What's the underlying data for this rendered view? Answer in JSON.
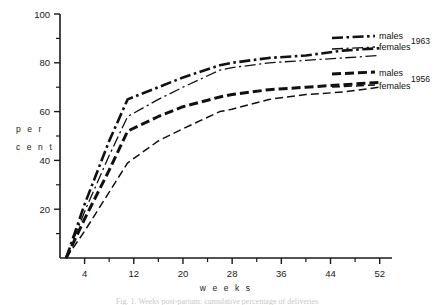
{
  "figure": {
    "caption": "Fig. 1. Weeks post-partum: cumulative percentage of deliveries"
  },
  "axes": {
    "y_title_line1": "p e r",
    "y_title_line2": "c e n t",
    "x_title": "w e e k s",
    "y_ticklabels": [
      "100",
      "80",
      "60",
      "40",
      "20"
    ],
    "x_ticklabels": [
      "4",
      "12",
      "20",
      "28",
      "36",
      "44",
      "52"
    ]
  },
  "legend": {
    "entries": [
      {
        "label": "males",
        "year": "1963",
        "style": "dashdot-thick"
      },
      {
        "label": "females",
        "year": "",
        "style": "dashdot-thin"
      },
      {
        "label": "males",
        "year": "1956",
        "style": "dash-thick"
      },
      {
        "label": "females",
        "year": "",
        "style": "dash-thin"
      }
    ],
    "year_1963": "1963",
    "year_1956": "1956"
  },
  "chart_data": {
    "type": "line",
    "title": "",
    "xlabel": "weeks",
    "ylabel": "per cent",
    "xlim": [
      0,
      54
    ],
    "ylim": [
      0,
      100
    ],
    "xticks": [
      4,
      12,
      20,
      28,
      36,
      44,
      52
    ],
    "xticks_minor": [
      8,
      16,
      24,
      32,
      40,
      48
    ],
    "yticks": [
      20,
      40,
      60,
      80,
      100
    ],
    "yticks_minor": [
      10,
      30,
      50,
      70,
      90
    ],
    "grid": false,
    "legend_position": "right",
    "x": [
      1,
      4,
      8,
      11,
      16,
      20,
      26,
      28,
      34,
      40,
      46,
      52
    ],
    "series": [
      {
        "name": "males 1963",
        "style": "dashdot-thick",
        "values": [
          0,
          22,
          48,
          65,
          70,
          74,
          79,
          80,
          82,
          83,
          85,
          86
        ]
      },
      {
        "name": "females 1963",
        "style": "dashdot-thin",
        "values": [
          0,
          19,
          42,
          58,
          65,
          70,
          77,
          78,
          80,
          81,
          82,
          83
        ]
      },
      {
        "name": "males 1956",
        "style": "dash-thick",
        "values": [
          0,
          16,
          36,
          52,
          58,
          62,
          66,
          67,
          69,
          70,
          71,
          72
        ]
      },
      {
        "name": "females 1956",
        "style": "dash-thin",
        "values": [
          0,
          11,
          27,
          39,
          48,
          53,
          60,
          61,
          65,
          67,
          68,
          70
        ]
      }
    ]
  }
}
